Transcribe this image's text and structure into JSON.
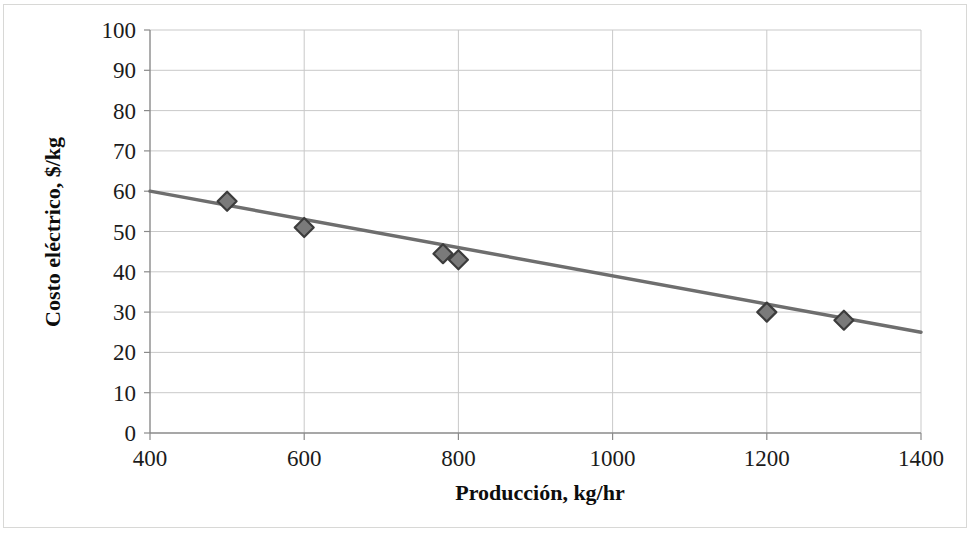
{
  "chart_data": {
    "type": "scatter",
    "title": "",
    "xlabel": "Producción, kg/hr",
    "ylabel": "Costo eléctrico, $/kg",
    "xlim": [
      400,
      1400
    ],
    "ylim": [
      0,
      100
    ],
    "xticks": [
      400,
      600,
      800,
      1000,
      1200,
      1400
    ],
    "yticks": [
      0,
      10,
      20,
      30,
      40,
      50,
      60,
      70,
      80,
      90,
      100
    ],
    "grid": true,
    "legend": "none",
    "series": [
      {
        "name": "Costo eléctrico",
        "marker": "diamond",
        "marker_color": "#7a7a7a",
        "marker_edge_color": "#3c3c3c",
        "x": [
          500,
          600,
          780,
          800,
          1200,
          1300
        ],
        "y": [
          57.5,
          51,
          44.5,
          43,
          30,
          28
        ]
      },
      {
        "name": "Línea de tendencia",
        "type": "line",
        "line_color": "#6e6e6e",
        "x": [
          400,
          1400
        ],
        "y": [
          60,
          25
        ]
      }
    ]
  },
  "axes": {
    "x_title": "Producción, kg/hr",
    "y_title": "Costo eléctrico, $/kg",
    "x_tick_labels": [
      "400",
      "600",
      "800",
      "1000",
      "1200",
      "1400"
    ],
    "y_tick_labels": [
      "0",
      "10",
      "20",
      "30",
      "40",
      "50",
      "60",
      "70",
      "80",
      "90",
      "100"
    ]
  },
  "colors": {
    "gridline": "#c9c9c9",
    "axis": "#8a8a8a",
    "trendline": "#6e6e6e",
    "marker_fill": "#7a7a7a",
    "marker_edge": "#3c3c3c",
    "text": "#1b1b1b",
    "page_border": "#d8d8d6",
    "background": "#ffffff"
  }
}
